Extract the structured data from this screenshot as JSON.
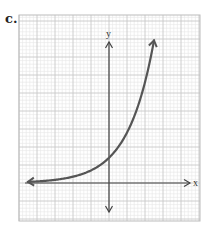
{
  "figure_label": "c.",
  "chart_data": {
    "type": "line",
    "title": "",
    "xlabel": "x",
    "ylabel": "y",
    "function": "y = 1.4 * 2^x",
    "x": [
      -4.5,
      -4,
      -3,
      -2,
      -1,
      0,
      1,
      2,
      2.5
    ],
    "y": [
      0.06,
      0.09,
      0.18,
      0.35,
      0.7,
      1.4,
      2.8,
      5.6,
      7.9
    ],
    "xlim": [
      -5,
      5
    ],
    "ylim": [
      -2,
      9.4
    ],
    "grid": true,
    "grid_major_step": 1,
    "grid_minor_per_major": 5,
    "tick_labels": false,
    "legend": null,
    "colors": {
      "curve": "#555555",
      "axes": "#444444",
      "grid_major": "#c8c8c8",
      "grid_minor": "#e6e6e6",
      "border": "#bbbbbb"
    }
  }
}
